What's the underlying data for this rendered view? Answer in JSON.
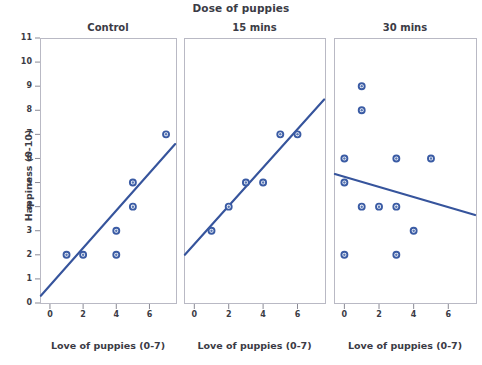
{
  "figure": {
    "suptitle": "Dose of puppies",
    "ylabel": "Happiness (0-10)"
  },
  "chart_data": {
    "type": "scatter",
    "title": "Dose of puppies",
    "ylabel": "Happiness (0-10)",
    "xlabel": "Love of puppies (0-7)",
    "ylim": [
      0,
      11
    ],
    "xlim": [
      -0.6,
      7.6
    ],
    "yticks": [
      0,
      1,
      2,
      3,
      4,
      5,
      6,
      7,
      8,
      9,
      10,
      11
    ],
    "xticks": [
      0,
      2,
      4,
      6
    ],
    "grid": false,
    "legend": "none",
    "panels": [
      {
        "label": "Control",
        "xlabel": "Love of puppies (0-7)",
        "points": [
          {
            "x": 1,
            "y": 2
          },
          {
            "x": 2,
            "y": 2
          },
          {
            "x": 4,
            "y": 3
          },
          {
            "x": 4,
            "y": 2
          },
          {
            "x": 5,
            "y": 5
          },
          {
            "x": 5,
            "y": 4
          },
          {
            "x": 7,
            "y": 7
          }
        ],
        "fit_line": {
          "x0": -0.55,
          "y0": 0.3,
          "x1": 7.55,
          "y1": 6.6
        }
      },
      {
        "label": "15 mins",
        "xlabel": "Love of puppies (0-7)",
        "points": [
          {
            "x": 1,
            "y": 3
          },
          {
            "x": 2,
            "y": 4
          },
          {
            "x": 3,
            "y": 5
          },
          {
            "x": 4,
            "y": 5
          },
          {
            "x": 5,
            "y": 7
          },
          {
            "x": 6,
            "y": 7
          }
        ],
        "fit_line": {
          "x0": -0.55,
          "y0": 2.0,
          "x1": 7.55,
          "y1": 8.45
        }
      },
      {
        "label": "30 mins",
        "xlabel": "Love of puppies (0-7)",
        "points": [
          {
            "x": 1,
            "y": 9
          },
          {
            "x": 1,
            "y": 8
          },
          {
            "x": 0,
            "y": 6
          },
          {
            "x": 3,
            "y": 6
          },
          {
            "x": 5,
            "y": 6
          },
          {
            "x": 0,
            "y": 5
          },
          {
            "x": 1,
            "y": 4
          },
          {
            "x": 2,
            "y": 4
          },
          {
            "x": 3,
            "y": 4
          },
          {
            "x": 4,
            "y": 3
          },
          {
            "x": 0,
            "y": 2
          },
          {
            "x": 3,
            "y": 2
          }
        ],
        "fit_line": {
          "x0": -0.55,
          "y0": 5.35,
          "x1": 7.55,
          "y1": 3.65
        }
      }
    ]
  }
}
